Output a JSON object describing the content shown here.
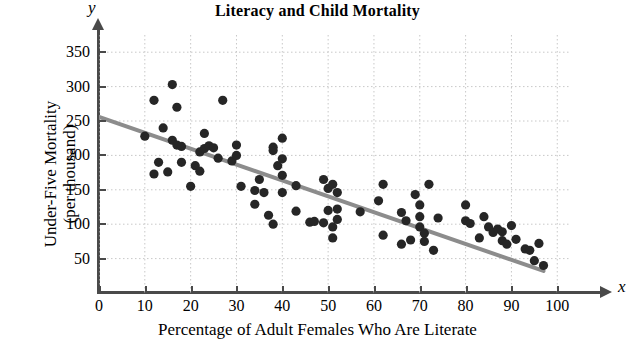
{
  "chart_data": {
    "type": "scatter",
    "title": "Literacy and Child Mortality",
    "xlabel": "Percentage of Adult Females Who Are Literate",
    "ylabel_line1": "Under-Five Mortality",
    "ylabel_line2": "(per thousand)",
    "x_axis_letter": "x",
    "y_axis_letter": "y",
    "xlim": [
      0,
      103
    ],
    "ylim": [
      0,
      375
    ],
    "xticks": [
      0,
      10,
      20,
      30,
      40,
      50,
      60,
      70,
      80,
      90,
      100
    ],
    "yticks": [
      50,
      100,
      150,
      200,
      250,
      300,
      350
    ],
    "grid": true,
    "grid_style": "dotted",
    "grid_color": "#c8c8c8",
    "point_color": "#262626",
    "point_radius": 4.6,
    "legend": null,
    "trendline": {
      "label": "least-squares regression line",
      "color": "#8c8c8c",
      "width": 4,
      "x_start": 0,
      "y_start": 256,
      "x_end": 97,
      "y_end": 32
    },
    "points": [
      [
        10,
        228
      ],
      [
        12,
        280
      ],
      [
        12,
        173
      ],
      [
        13,
        190
      ],
      [
        14,
        240
      ],
      [
        15,
        176
      ],
      [
        16,
        303
      ],
      [
        16,
        222
      ],
      [
        17,
        270
      ],
      [
        17,
        215
      ],
      [
        18,
        213
      ],
      [
        18,
        190
      ],
      [
        20,
        155
      ],
      [
        21,
        185
      ],
      [
        22,
        205
      ],
      [
        22,
        177
      ],
      [
        23,
        232
      ],
      [
        23,
        210
      ],
      [
        24,
        214
      ],
      [
        25,
        211
      ],
      [
        26,
        196
      ],
      [
        27,
        280
      ],
      [
        29,
        192
      ],
      [
        30,
        215
      ],
      [
        30,
        200
      ],
      [
        31,
        155
      ],
      [
        34,
        149
      ],
      [
        34,
        129
      ],
      [
        35,
        165
      ],
      [
        36,
        146
      ],
      [
        37,
        113
      ],
      [
        38,
        207
      ],
      [
        38,
        212
      ],
      [
        38,
        100
      ],
      [
        39,
        185
      ],
      [
        40,
        195
      ],
      [
        40,
        225
      ],
      [
        40,
        171
      ],
      [
        40,
        146
      ],
      [
        43,
        119
      ],
      [
        43,
        156
      ],
      [
        46,
        103
      ],
      [
        47,
        104
      ],
      [
        49,
        165
      ],
      [
        49,
        102
      ],
      [
        50,
        120
      ],
      [
        50,
        152
      ],
      [
        51,
        96
      ],
      [
        51,
        80
      ],
      [
        51,
        158
      ],
      [
        52,
        146
      ],
      [
        52,
        122
      ],
      [
        52,
        107
      ],
      [
        57,
        118
      ],
      [
        61,
        134
      ],
      [
        62,
        158
      ],
      [
        62,
        84
      ],
      [
        66,
        117
      ],
      [
        66,
        71
      ],
      [
        67,
        105
      ],
      [
        68,
        77
      ],
      [
        69,
        143
      ],
      [
        70,
        111
      ],
      [
        70,
        128
      ],
      [
        70,
        96
      ],
      [
        71,
        87
      ],
      [
        71,
        75
      ],
      [
        72,
        158
      ],
      [
        73,
        62
      ],
      [
        74,
        109
      ],
      [
        80,
        128
      ],
      [
        80,
        105
      ],
      [
        81,
        101
      ],
      [
        83,
        80
      ],
      [
        84,
        111
      ],
      [
        85,
        96
      ],
      [
        86,
        88
      ],
      [
        87,
        93
      ],
      [
        88,
        76
      ],
      [
        88,
        89
      ],
      [
        89,
        71
      ],
      [
        90,
        98
      ],
      [
        91,
        78
      ],
      [
        93,
        64
      ],
      [
        94,
        62
      ],
      [
        95,
        47
      ],
      [
        96,
        72
      ],
      [
        97,
        40
      ]
    ]
  }
}
